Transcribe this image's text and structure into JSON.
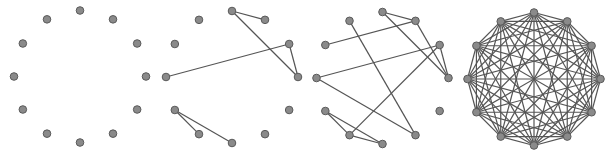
{
  "figure": {
    "node_count": 12,
    "colors": {
      "edge": "#555555",
      "node_fill": "#8a8a8a",
      "node_stroke": "#5a5a5a",
      "background": "#ffffff"
    },
    "node_radius": 3.8,
    "panels": [
      {
        "id": "panel-1",
        "cx": 80,
        "cy": 76.5,
        "r": 66,
        "edges": []
      },
      {
        "id": "panel-2",
        "cx": 232,
        "cy": 77,
        "r": 66,
        "edges": [
          [
            0,
            1
          ],
          [
            0,
            3
          ],
          [
            2,
            3
          ],
          [
            2,
            9
          ],
          [
            8,
            7
          ],
          [
            8,
            6
          ]
        ]
      },
      {
        "id": "panel-3",
        "cx": 382.5,
        "cy": 78,
        "r": 66,
        "edges": [
          [
            0,
            1
          ],
          [
            0,
            3
          ],
          [
            1,
            3
          ],
          [
            1,
            10
          ],
          [
            2,
            3
          ],
          [
            2,
            9
          ],
          [
            2,
            7
          ],
          [
            9,
            5
          ],
          [
            11,
            5
          ],
          [
            8,
            7
          ],
          [
            8,
            6
          ],
          [
            7,
            6
          ]
        ]
      },
      {
        "id": "panel-4",
        "cx": 534,
        "cy": 79,
        "r": 66.5,
        "complete": true,
        "edges": []
      }
    ]
  }
}
